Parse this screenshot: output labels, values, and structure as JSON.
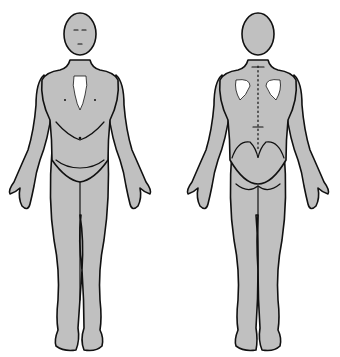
{
  "diagram": {
    "type": "body-chart",
    "views": [
      {
        "id": "front",
        "label": "Anterior view"
      },
      {
        "id": "back",
        "label": "Posterior view"
      }
    ],
    "colors": {
      "fill": "#c0c0c0",
      "outline": "#111111",
      "background": "#ffffff",
      "highlight": "#ffffff"
    }
  }
}
